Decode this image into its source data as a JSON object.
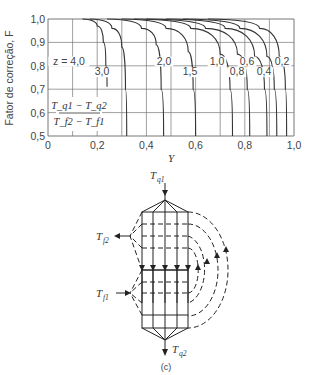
{
  "chart_data": {
    "type": "line",
    "title": "",
    "xlabel": "Y",
    "ylabel": "Fator de correção, F",
    "xlim": [
      0,
      1.0
    ],
    "ylim": [
      0.5,
      1.0
    ],
    "grid": true,
    "x_ticks": [
      "0",
      "0,2",
      "0,4",
      "0,6",
      "0,8",
      "1,0"
    ],
    "y_ticks": [
      "0,5",
      "0,6",
      "0,7",
      "0,8",
      "0,9",
      "1,0"
    ],
    "annotation": {
      "numerator": "T_q1 − T_q2",
      "denominator": "T_f2 − T_f1"
    },
    "series": [
      {
        "name": "z = 4,0",
        "label": "z = 4,0",
        "points": [
          [
            0.14,
            1.0
          ],
          [
            0.2,
            0.97
          ],
          [
            0.225,
            0.9
          ],
          [
            0.235,
            0.8
          ],
          [
            0.24,
            0.71
          ]
        ]
      },
      {
        "name": "3,0",
        "label": "3,0",
        "points": [
          [
            0.17,
            1.0
          ],
          [
            0.26,
            0.96
          ],
          [
            0.3,
            0.88
          ],
          [
            0.315,
            0.7
          ],
          [
            0.32,
            0.5
          ]
        ]
      },
      {
        "name": "2,0",
        "label": "2,0",
        "points": [
          [
            0.24,
            1.0
          ],
          [
            0.38,
            0.96
          ],
          [
            0.44,
            0.89
          ],
          [
            0.46,
            0.7
          ],
          [
            0.47,
            0.5
          ]
        ]
      },
      {
        "name": "1,5",
        "label": "1,5",
        "points": [
          [
            0.3,
            1.0
          ],
          [
            0.48,
            0.96
          ],
          [
            0.57,
            0.86
          ],
          [
            0.59,
            0.7
          ],
          [
            0.6,
            0.5
          ]
        ]
      },
      {
        "name": "1,0",
        "label": "1,0",
        "points": [
          [
            0.35,
            1.0
          ],
          [
            0.58,
            0.96
          ],
          [
            0.7,
            0.85
          ],
          [
            0.74,
            0.7
          ],
          [
            0.75,
            0.5
          ]
        ]
      },
      {
        "name": "0,8",
        "label": "0,8",
        "points": [
          [
            0.4,
            1.0
          ],
          [
            0.64,
            0.96
          ],
          [
            0.77,
            0.85
          ],
          [
            0.81,
            0.7
          ],
          [
            0.82,
            0.5
          ]
        ]
      },
      {
        "name": "0,6",
        "label": "0,6",
        "points": [
          [
            0.48,
            1.0
          ],
          [
            0.72,
            0.96
          ],
          [
            0.84,
            0.84
          ],
          [
            0.88,
            0.7
          ],
          [
            0.89,
            0.5
          ]
        ]
      },
      {
        "name": "0,4",
        "label": "0,4",
        "points": [
          [
            0.55,
            1.0
          ],
          [
            0.78,
            0.96
          ],
          [
            0.89,
            0.84
          ],
          [
            0.92,
            0.7
          ],
          [
            0.93,
            0.5
          ]
        ]
      },
      {
        "name": "0,2",
        "label": "0,2",
        "points": [
          [
            0.65,
            1.0
          ],
          [
            0.86,
            0.96
          ],
          [
            0.94,
            0.84
          ],
          [
            0.965,
            0.7
          ],
          [
            0.97,
            0.5
          ]
        ]
      }
    ]
  },
  "diagram": {
    "caption": "(c)",
    "labels": {
      "tq1": "T",
      "tq1_sub": "q1",
      "tq2": "T",
      "tq2_sub": "q2",
      "tf1": "T",
      "tf1_sub": "f1",
      "tf2": "T",
      "tf2_sub": "f2"
    }
  }
}
